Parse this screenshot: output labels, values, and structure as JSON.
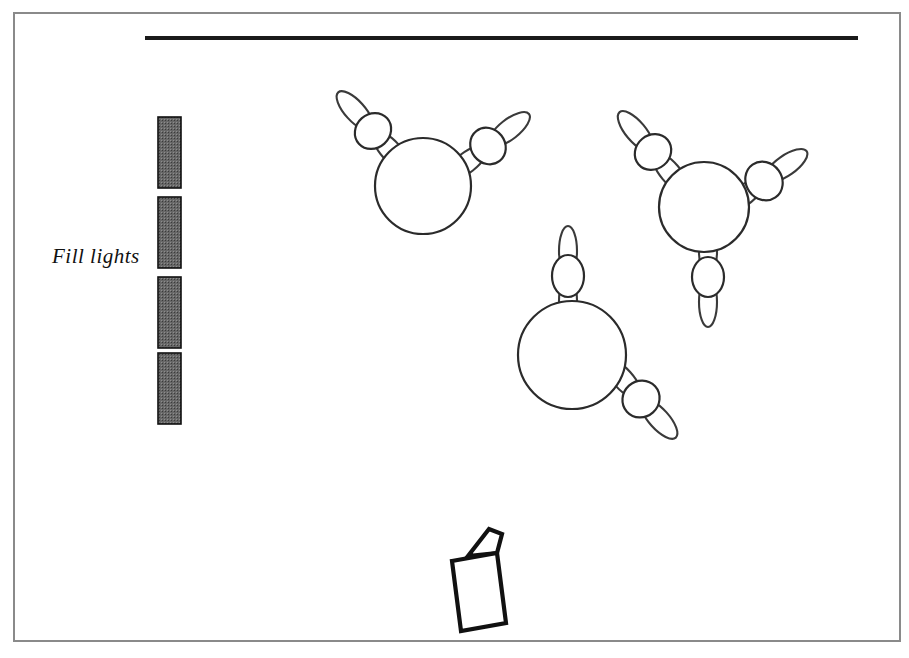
{
  "figure": {
    "domain": "diagram",
    "background_color": "#ffffff",
    "width": 909,
    "height": 658,
    "line_color": "#2b2b2b",
    "fill_light_color": "#676767"
  },
  "frame": {
    "name": "outer-border",
    "x": 14,
    "y": 13,
    "width": 886,
    "height": 628,
    "stroke": "#8a8a8a",
    "stroke_width": 2
  },
  "ceiling_line": {
    "name": "ceiling-rail",
    "x1": 145,
    "y1": 38,
    "x2": 858,
    "y2": 38,
    "stroke": "#1a1a1a",
    "stroke_width": 4
  },
  "labels": [
    {
      "id": "fill-lights-label",
      "text": "Fill  lights",
      "x": 52,
      "y": 263,
      "style": "italic-serif",
      "font_size": 21
    }
  ],
  "fill_lights": {
    "label": "Fill  lights",
    "count": 4,
    "bar_width": 23,
    "bar_x": 158,
    "fill": "#676767",
    "stroke": "#111111",
    "bars": [
      {
        "id": "fill-light-1",
        "y": 117,
        "height": 71
      },
      {
        "id": "fill-light-2",
        "y": 197,
        "height": 71
      },
      {
        "id": "fill-light-3",
        "y": 277,
        "height": 71
      },
      {
        "id": "fill-light-4",
        "y": 353,
        "height": 71
      }
    ]
  },
  "drones": [
    {
      "id": "drone-1",
      "label": "drone-upper-left",
      "body": {
        "cx": 423,
        "cy": 186,
        "r": 48
      },
      "rotors": [
        {
          "id": "drone-1-rotor-left",
          "cx": 373,
          "cy": 131,
          "rx": 19,
          "ry": 17,
          "blade_rx": 25,
          "blade_ry": 10,
          "blade_offset": 27,
          "angle": -42
        },
        {
          "id": "drone-1-rotor-right",
          "cx": 488,
          "cy": 146,
          "rx": 19,
          "ry": 17,
          "blade_rx": 25,
          "blade_ry": 10,
          "blade_offset": 27,
          "angle": 52
        }
      ]
    },
    {
      "id": "drone-2",
      "label": "drone-upper-right",
      "body": {
        "cx": 704,
        "cy": 207,
        "r": 45
      },
      "rotors": [
        {
          "id": "drone-2-rotor-upper-left",
          "cx": 653,
          "cy": 152,
          "rx": 19,
          "ry": 17,
          "blade_rx": 25,
          "blade_ry": 10,
          "blade_offset": 27,
          "angle": -40
        },
        {
          "id": "drone-2-rotor-right",
          "cx": 764,
          "cy": 181,
          "rx": 20,
          "ry": 18,
          "blade_rx": 25,
          "blade_ry": 10,
          "blade_offset": 27,
          "angle": 55
        },
        {
          "id": "drone-2-rotor-bottom",
          "cx": 708,
          "cy": 277,
          "rx": 16,
          "ry": 20,
          "blade_rx": 25,
          "blade_ry": 9,
          "blade_offset": 25,
          "angle": 0
        }
      ]
    },
    {
      "id": "drone-3",
      "label": "drone-center",
      "body": {
        "cx": 572,
        "cy": 355,
        "r": 54
      },
      "rotors": [
        {
          "id": "drone-3-rotor-top",
          "cx": 568,
          "cy": 276,
          "rx": 16,
          "ry": 21,
          "blade_rx": 25,
          "blade_ry": 9,
          "blade_offset": 25,
          "angle": 0
        },
        {
          "id": "drone-3-rotor-bottom-right",
          "cx": 641,
          "cy": 399,
          "rx": 19,
          "ry": 18,
          "blade_rx": 25,
          "blade_ry": 10,
          "blade_offset": 27,
          "angle": -42
        }
      ]
    }
  ],
  "camera": {
    "id": "camera-rig",
    "label": "camera",
    "body_points": "452,561 497,553 506,623 461,631",
    "lens_points": "468,556 489,529 502,534 497,553",
    "stroke": "#111111",
    "stroke_width": 4.2
  }
}
